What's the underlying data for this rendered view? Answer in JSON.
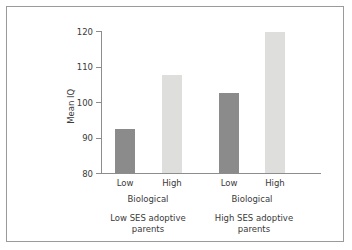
{
  "chart_data": {
    "type": "bar",
    "title": "",
    "subtitle": "",
    "xlabel": "",
    "ylabel": "Mean IQ",
    "ylim": [
      80,
      120
    ],
    "yticks": [
      80,
      90,
      100,
      110,
      120
    ],
    "ytick_labels": [
      "80",
      "90",
      "100",
      "110",
      "120"
    ],
    "grid": false,
    "legend": false,
    "legend_position": "none",
    "categories": [
      "Low",
      "High",
      "Low",
      "High"
    ],
    "values": [
      92.5,
      107.7,
      102.6,
      119.6
    ],
    "bar_colors": [
      "#8b8b8b",
      "#dededd",
      "#8b8b8b",
      "#dededd"
    ],
    "groups": [
      {
        "axis_label": "Biological",
        "outer_label": "Low SES adoptive parents",
        "bars": [
          {
            "category": "Low",
            "value": 92.5,
            "color": "#8b8b8b"
          },
          {
            "category": "High",
            "value": 107.7,
            "color": "#dededd"
          }
        ]
      },
      {
        "axis_label": "Biological",
        "outer_label": "High SES adoptive parents",
        "bars": [
          {
            "category": "Low",
            "value": 102.6,
            "color": "#8b8b8b"
          },
          {
            "category": "High",
            "value": 119.6,
            "color": "#dededd"
          }
        ]
      }
    ],
    "annotations": []
  },
  "axis": {
    "y_title": "Mean IQ",
    "ticks": [
      {
        "label": "120",
        "value": 120
      },
      {
        "label": "110",
        "value": 110
      },
      {
        "label": "100",
        "value": 100
      },
      {
        "label": "90",
        "value": 90
      },
      {
        "label": "80",
        "value": 80
      }
    ]
  },
  "bars": [
    {
      "label": "Low",
      "value": 92.5,
      "color": "#8b8b8b"
    },
    {
      "label": "High",
      "value": 107.7,
      "color": "#dededd"
    },
    {
      "label": "Low",
      "value": 102.6,
      "color": "#8b8b8b"
    },
    {
      "label": "High",
      "value": 119.6,
      "color": "#dededd"
    }
  ],
  "group_axis_labels": [
    {
      "label": "Biological"
    },
    {
      "label": "Biological"
    }
  ],
  "outer_group_labels": [
    {
      "line1": "Low SES adoptive",
      "line2": "parents"
    },
    {
      "line1": "High SES adoptive",
      "line2": "parents"
    }
  ],
  "colors": {
    "frame_border": "#9a9a9a",
    "axis": "#8d8d8d",
    "text": "#3a3a3a",
    "bar_dark": "#8b8b8b",
    "bar_light": "#dededd",
    "background": "#ffffff"
  }
}
